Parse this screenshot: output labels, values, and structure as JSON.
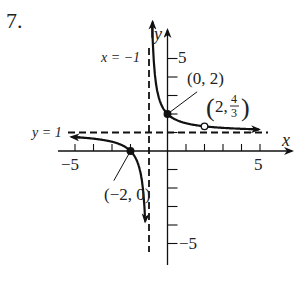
{
  "problem_number": "7.",
  "chart_data": {
    "type": "line",
    "title": "",
    "function": "f(x) = (x+2)/(x+1), x ≠ 2",
    "xlabel": "x",
    "ylabel": "y",
    "xlim": [
      -5,
      5
    ],
    "ylim": [
      -5,
      5
    ],
    "x_ticks": [
      -5,
      -4,
      -3,
      -2,
      -1,
      1,
      2,
      3,
      4,
      5
    ],
    "y_ticks": [
      -5,
      -4,
      -3,
      -2,
      -1,
      1,
      2,
      3,
      4,
      5
    ],
    "x_tick_labels": [
      "-5",
      "5"
    ],
    "y_tick_labels": [
      "5",
      "-5"
    ],
    "grid": false,
    "asymptotes": {
      "vertical": {
        "x": -1,
        "label": "x = −1"
      },
      "horizontal": {
        "y": 1,
        "label": "y = 1"
      }
    },
    "points": [
      {
        "x": 0,
        "y": 2,
        "label": "(0, 2)",
        "type": "filled"
      },
      {
        "x": -2,
        "y": 0,
        "label": "(−2, 0)",
        "type": "filled"
      },
      {
        "x": 2,
        "y": 1.3333,
        "label": "(2, 4/3)",
        "type": "open"
      }
    ],
    "labels": {
      "x_axis": "x",
      "y_axis": "y",
      "tick_pos5": "5",
      "tick_neg5": "−5",
      "ytick_pos5": "5",
      "ytick_neg5": "−5",
      "va": "x = −1",
      "ha": "y = 1",
      "p1": "(0, 2)",
      "p2": "(−2, 0)",
      "p3_x": "2,",
      "p3_num": "4",
      "p3_den": "3"
    }
  }
}
